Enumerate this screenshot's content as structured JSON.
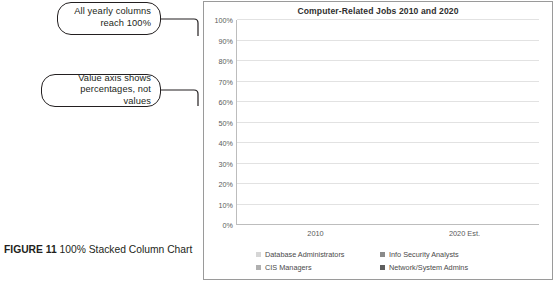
{
  "figure": {
    "label": "FIGURE 11",
    "caption": "100% Stacked Column Chart"
  },
  "callouts": [
    {
      "id": "callout-1",
      "text": "All yearly columns\nreach 100%"
    },
    {
      "id": "callout-2",
      "text": "Value axis shows\npercentages, not values"
    }
  ],
  "chart_data": {
    "type": "bar",
    "variant": "100% stacked column",
    "title": "Computer-Related Jobs 2010 and 2020",
    "xlabel": "",
    "ylabel": "",
    "ylim": [
      0,
      100
    ],
    "yunit": "%",
    "grid": true,
    "legend_position": "bottom",
    "categories": [
      "2010",
      "2020 Est."
    ],
    "ytick_labels": [
      "0%",
      "10%",
      "20%",
      "30%",
      "40%",
      "50%",
      "60%",
      "70%",
      "80%",
      "90%",
      "100%"
    ],
    "ytick_values": [
      0,
      10,
      20,
      30,
      40,
      50,
      60,
      70,
      80,
      90,
      100
    ],
    "series": [
      {
        "name": "Database Administrators",
        "color": "#d6d6d6",
        "values": [
          10,
          10
        ]
      },
      {
        "name": "CIS Managers",
        "color": "#b0b0b0",
        "values": [
          30,
          32
        ]
      },
      {
        "name": "Info Security Analysts",
        "color": "#8a8a8a",
        "values": [
          28,
          25
        ]
      },
      {
        "name": "Network/System Admins",
        "color": "#5e5e5e",
        "values": [
          32,
          33
        ]
      }
    ],
    "totals": [
      100,
      100
    ]
  },
  "colors": {
    "panel_border": "#9a9a9a",
    "gridline": "#e2e2e2",
    "axis": "#bdbdbd",
    "text": "#231f20",
    "tick_text": "#5a5a5a"
  }
}
